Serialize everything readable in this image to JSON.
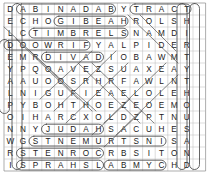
{
  "puzzle": {
    "title": "Word Search Grid",
    "rows": 14,
    "cols": 16,
    "cell_width": 12.6,
    "cell_height": 12.0,
    "origin_x": 4,
    "origin_y": 3,
    "grid": [
      [
        "D",
        "A",
        "B",
        "I",
        "N",
        "A",
        "D",
        "A",
        "B",
        "Y",
        "T",
        "R",
        "A",
        "C",
        "T",
        ""
      ],
      [
        "E",
        "C",
        "H",
        "O",
        "G",
        "I",
        "B",
        "E",
        "A",
        "H",
        "R",
        "O",
        "L",
        "S",
        "H",
        ""
      ],
      [
        "L",
        "C",
        "T",
        "I",
        "M",
        "B",
        "R",
        "E",
        "L",
        "S",
        "N",
        "A",
        "M",
        "D",
        "I",
        ""
      ],
      [
        "D",
        "O",
        "O",
        "W",
        "R",
        "I",
        "F",
        "Y",
        "A",
        "L",
        "P",
        "I",
        "D",
        "E",
        "R",
        ""
      ],
      [
        "E",
        "M",
        "R",
        "D",
        "I",
        "V",
        "A",
        "D",
        "I",
        "O",
        "B",
        "A",
        "W",
        "M",
        "T",
        ""
      ],
      [
        "Y",
        "P",
        "Q",
        "O",
        "A",
        "V",
        "E",
        "Z",
        "S",
        "U",
        "A",
        "X",
        "E",
        "A",
        "Y",
        ""
      ],
      [
        "A",
        "A",
        "U",
        "O",
        "O",
        "S",
        "R",
        "H",
        "R",
        "F",
        "A",
        "W",
        "L",
        "N",
        "T",
        ""
      ],
      [
        "L",
        "N",
        "I",
        "G",
        "U",
        "F",
        "I",
        "E",
        "A",
        "E",
        "L",
        "O",
        "L",
        "E",
        "H",
        ""
      ],
      [
        "P",
        "Y",
        "B",
        "O",
        "H",
        "T",
        "H",
        "O",
        "E",
        "Z",
        "E",
        "O",
        "E",
        "M",
        "O",
        ""
      ],
      [
        "O",
        "I",
        "H",
        "A",
        "R",
        "C",
        "X",
        "O",
        "L",
        "D",
        "Z",
        "P",
        "T",
        "N",
        "U",
        ""
      ],
      [
        "N",
        "N",
        "Y",
        "J",
        "U",
        "D",
        "A",
        "H",
        "S",
        "A",
        "C",
        "U",
        "H",
        "E",
        "S",
        ""
      ],
      [
        "W",
        "G",
        "S",
        "T",
        "N",
        "E",
        "M",
        "U",
        "R",
        "T",
        "S",
        "N",
        "I",
        "S",
        "A",
        ""
      ],
      [
        "R",
        "S",
        "T",
        "E",
        "N",
        "R",
        "O",
        "C",
        "R",
        "B",
        "S",
        "I",
        "T",
        "O",
        "N",
        ""
      ],
      [
        "I",
        "S",
        "P",
        "R",
        "A",
        "H",
        "S",
        "L",
        "A",
        "B",
        "M",
        "Y",
        "C",
        "H",
        "D",
        ""
      ]
    ],
    "marked_words": [
      {
        "word": "ABINADAB",
        "row": 0,
        "col": 1,
        "dir": "across",
        "len": 8
      },
      {
        "word": "TRACT",
        "row": 0,
        "col": 10,
        "dir": "across",
        "len": 5
      },
      {
        "word": "GIBEAH",
        "row": 1,
        "col": 4,
        "dir": "across",
        "len": 6
      },
      {
        "word": "TIMBRELS",
        "row": 2,
        "col": 2,
        "dir": "across",
        "len": 8
      },
      {
        "word": "FIRWOOD",
        "row": 3,
        "col": 0,
        "dir": "across",
        "len": 7
      },
      {
        "word": "DAVID",
        "row": 4,
        "col": 3,
        "dir": "across",
        "len": 5
      },
      {
        "word": "JUDAH",
        "row": 10,
        "col": 3,
        "dir": "across",
        "len": 5
      },
      {
        "word": "INSTRUMENTS",
        "row": 11,
        "col": 2,
        "dir": "across",
        "len": 11
      },
      {
        "word": "CORNETS",
        "row": 12,
        "col": 1,
        "dir": "across",
        "len": 7
      },
      {
        "word": "CYMBALS",
        "row": 13,
        "col": 1,
        "dir": "across",
        "len": 7
      },
      {
        "word": "HARPS",
        "row": 13,
        "col": 8,
        "dir": "across",
        "len": 5
      },
      {
        "word": "ACCOMPANYINGSSP",
        "row": 0,
        "col": 1,
        "dir": "down",
        "len": 14
      },
      {
        "word": "THIRTYTHOUSAND",
        "row": 0,
        "col": 15,
        "dir": "down",
        "len": 14
      },
      {
        "word": "EMANEMNESOHC",
        "row": 0,
        "col": 14,
        "dir": "down",
        "len": 14
      },
      {
        "word": "PLAYED",
        "row": 3,
        "col": 0,
        "dir": "down",
        "len": 6
      }
    ],
    "colors": {
      "grid_line": "#b9b9b9",
      "grid_border": "#8a8a8a",
      "letter": "#1a1a1a",
      "marker": "#4a4a4a",
      "background": "#ffffff"
    }
  }
}
